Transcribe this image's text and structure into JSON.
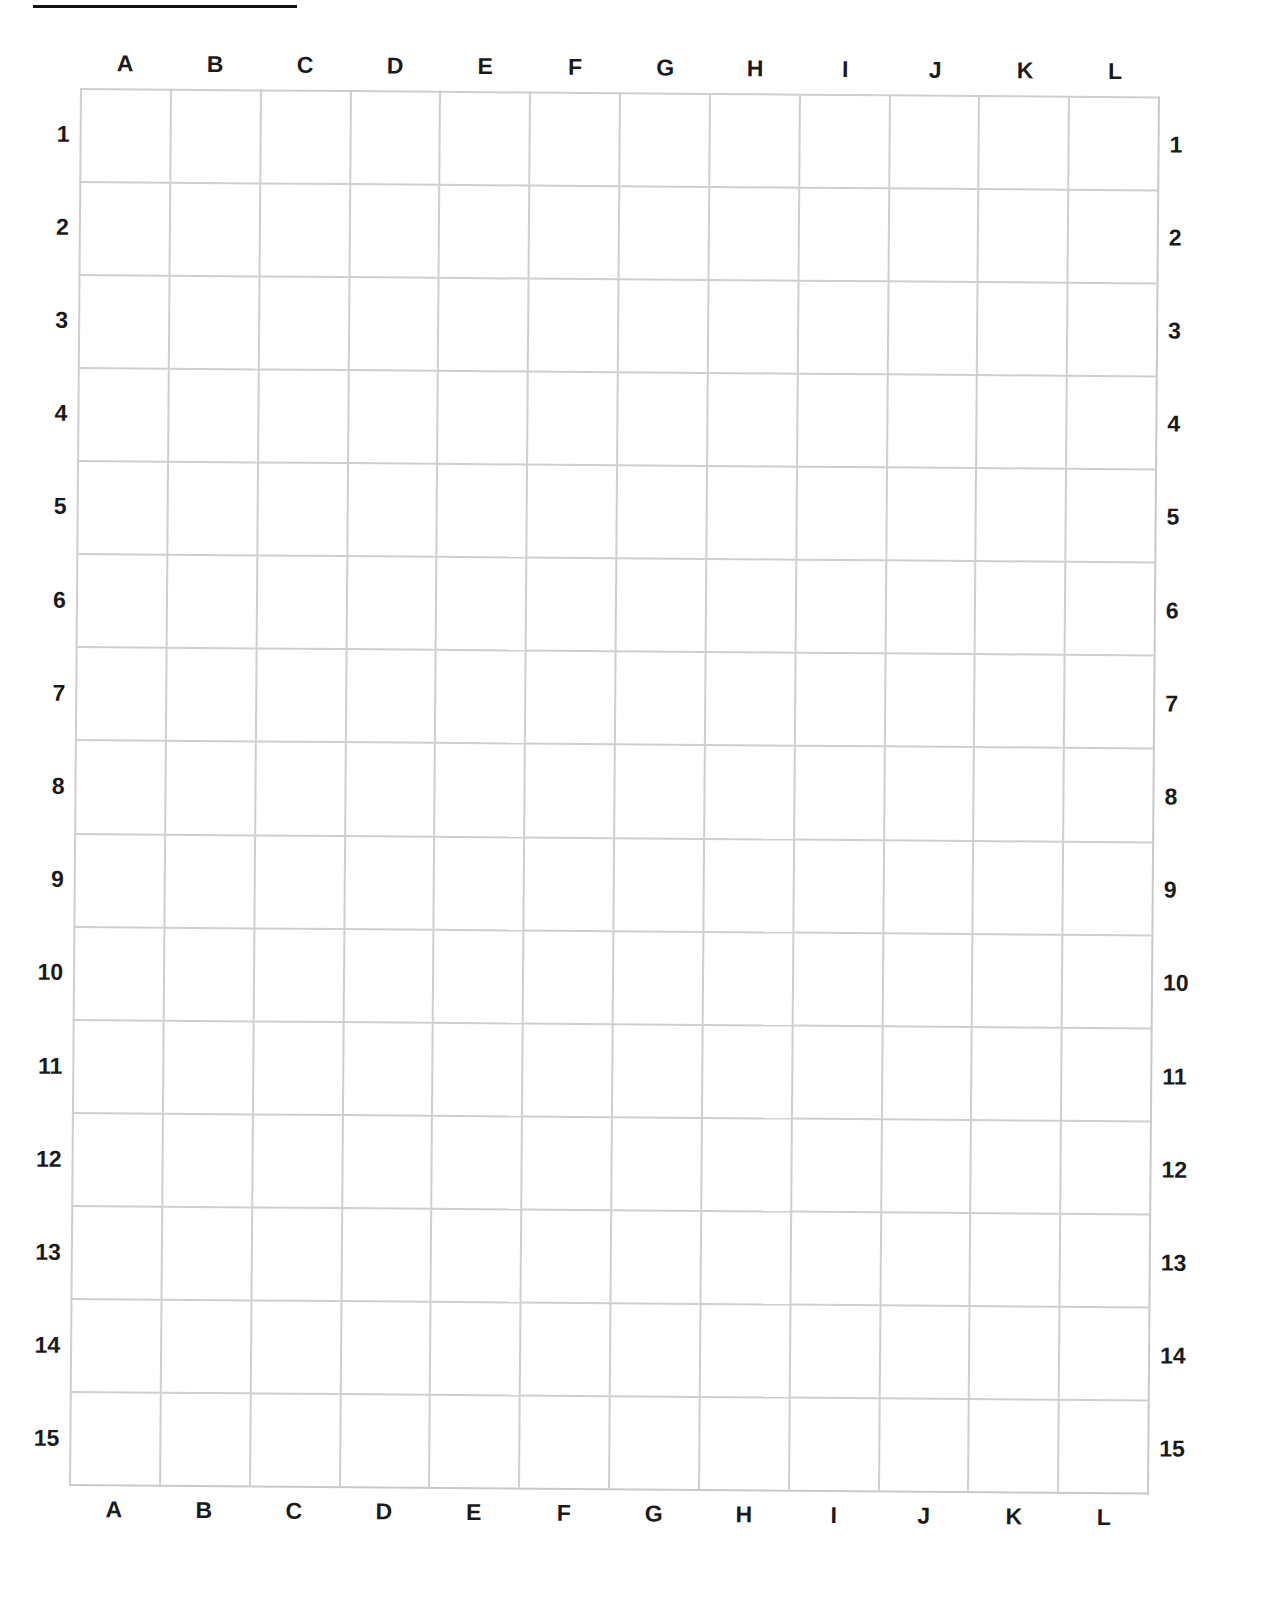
{
  "document": {
    "type": "blank lettered grid worksheet",
    "top_rule": true,
    "columns": [
      "A",
      "B",
      "C",
      "D",
      "E",
      "F",
      "G",
      "H",
      "I",
      "J",
      "K",
      "L"
    ],
    "rows": [
      "1",
      "2",
      "3",
      "4",
      "5",
      "6",
      "7",
      "8",
      "9",
      "10",
      "11",
      "12",
      "13",
      "14",
      "15"
    ],
    "cells_filled": []
  },
  "colors": {
    "gridline": "#cfcfcf",
    "label": "#1a1a1a",
    "background": "#ffffff"
  }
}
